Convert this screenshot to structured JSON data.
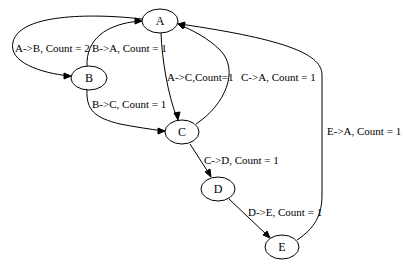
{
  "graph": {
    "type": "directed",
    "nodes": [
      {
        "id": "A",
        "label": "A",
        "cx": 160,
        "cy": 21
      },
      {
        "id": "B",
        "label": "B",
        "cx": 89,
        "cy": 78
      },
      {
        "id": "C",
        "label": "C",
        "cx": 182,
        "cy": 132
      },
      {
        "id": "D",
        "label": "D",
        "cx": 218,
        "cy": 189
      },
      {
        "id": "E",
        "label": "E",
        "cx": 282,
        "cy": 247
      }
    ],
    "edges": [
      {
        "from": "A",
        "to": "B",
        "count": 2,
        "label": "A->B, Count = 2"
      },
      {
        "from": "B",
        "to": "A",
        "count": 1,
        "label": "B->A, Count = 1"
      },
      {
        "from": "A",
        "to": "C",
        "count": 1,
        "label": "A->C,Count=1"
      },
      {
        "from": "C",
        "to": "A",
        "count": 1,
        "label": "C->A, Count = 1"
      },
      {
        "from": "B",
        "to": "C",
        "count": 1,
        "label": "B->C, Count = 1"
      },
      {
        "from": "C",
        "to": "D",
        "count": 1,
        "label": "C->D, Count = 1"
      },
      {
        "from": "D",
        "to": "E",
        "count": 1,
        "label": "D->E, Count = 1"
      },
      {
        "from": "E",
        "to": "A",
        "count": 1,
        "label": "E->A, Count = 1"
      }
    ]
  },
  "colors": {
    "stroke": "#000000",
    "background": "#ffffff",
    "text": "#000000"
  }
}
